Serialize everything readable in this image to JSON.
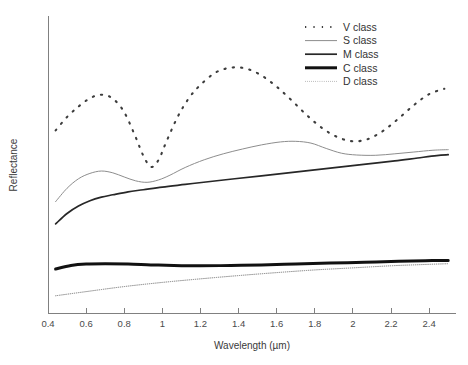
{
  "chart_data": {
    "type": "line",
    "title": "",
    "xlabel": "Wavelength (µm)",
    "ylabel": "Reflectance",
    "xlim": [
      0.4,
      2.52
    ],
    "ylim": [
      0,
      1
    ],
    "grid": false,
    "legend_position": "top-right",
    "xticks": [
      0.4,
      0.6,
      0.8,
      1.0,
      1.2,
      1.4,
      1.6,
      1.8,
      2.0,
      2.2,
      2.4
    ],
    "xticklabels": [
      "0.4",
      "0.6",
      "0.8",
      "1",
      "1.2",
      "1.4",
      "1.6",
      "1.8",
      "2",
      "2.2",
      "2.4"
    ],
    "yticks": [],
    "yticklabels": [],
    "series": [
      {
        "name": "V class",
        "style": "dotted-thick",
        "color": "#3d3d3d",
        "width": 2.1,
        "dash": "0.6 3.4",
        "x": [
          0.44,
          0.5,
          0.56,
          0.62,
          0.68,
          0.74,
          0.8,
          0.86,
          0.9,
          0.94,
          0.98,
          1.02,
          1.08,
          1.14,
          1.2,
          1.28,
          1.36,
          1.44,
          1.52,
          1.6,
          1.68,
          1.76,
          1.84,
          1.92,
          2.0,
          2.08,
          2.16,
          2.24,
          2.32,
          2.4,
          2.48
        ],
        "y": [
          0.615,
          0.66,
          0.695,
          0.723,
          0.735,
          0.722,
          0.676,
          0.592,
          0.53,
          0.492,
          0.515,
          0.575,
          0.66,
          0.724,
          0.768,
          0.81,
          0.826,
          0.823,
          0.8,
          0.762,
          0.715,
          0.665,
          0.622,
          0.592,
          0.578,
          0.586,
          0.614,
          0.655,
          0.7,
          0.737,
          0.755
        ]
      },
      {
        "name": "S class",
        "style": "solid-thin",
        "color": "#8d8d8d",
        "width": 1.0,
        "dash": "",
        "x": [
          0.44,
          0.5,
          0.56,
          0.62,
          0.68,
          0.74,
          0.8,
          0.86,
          0.92,
          0.98,
          1.04,
          1.12,
          1.22,
          1.32,
          1.42,
          1.52,
          1.62,
          1.7,
          1.78,
          1.86,
          1.94,
          2.02,
          2.12,
          2.22,
          2.32,
          2.42,
          2.5
        ],
        "y": [
          0.375,
          0.42,
          0.452,
          0.47,
          0.478,
          0.472,
          0.458,
          0.445,
          0.44,
          0.448,
          0.464,
          0.49,
          0.516,
          0.536,
          0.552,
          0.566,
          0.576,
          0.578,
          0.572,
          0.554,
          0.538,
          0.532,
          0.531,
          0.536,
          0.542,
          0.548,
          0.55
        ]
      },
      {
        "name": "M class",
        "style": "solid-medium",
        "color": "#272727",
        "width": 1.7,
        "dash": "",
        "x": [
          0.44,
          0.5,
          0.56,
          0.62,
          0.68,
          0.74,
          0.82,
          0.9,
          1.0,
          1.12,
          1.24,
          1.38,
          1.52,
          1.66,
          1.8,
          1.94,
          2.08,
          2.22,
          2.34,
          2.44,
          2.5
        ],
        "y": [
          0.3,
          0.335,
          0.36,
          0.378,
          0.39,
          0.398,
          0.408,
          0.415,
          0.424,
          0.433,
          0.442,
          0.452,
          0.462,
          0.472,
          0.482,
          0.492,
          0.502,
          0.512,
          0.522,
          0.53,
          0.533
        ]
      },
      {
        "name": "C class",
        "style": "solid-thick",
        "color": "#111111",
        "width": 3.0,
        "dash": "",
        "x": [
          0.44,
          0.52,
          0.6,
          0.7,
          0.82,
          0.94,
          1.06,
          1.2,
          1.36,
          1.52,
          1.7,
          1.88,
          2.06,
          2.24,
          2.38,
          2.5
        ],
        "y": [
          0.148,
          0.16,
          0.165,
          0.166,
          0.165,
          0.162,
          0.16,
          0.159,
          0.16,
          0.162,
          0.165,
          0.168,
          0.171,
          0.174,
          0.176,
          0.177
        ]
      },
      {
        "name": "D class",
        "style": "dotted-thin",
        "color": "#7a7a7a",
        "width": 1.0,
        "dash": "0.5 1.6",
        "x": [
          0.44,
          0.6,
          0.8,
          1.0,
          1.2,
          1.4,
          1.6,
          1.8,
          2.0,
          2.2,
          2.36,
          2.5
        ],
        "y": [
          0.058,
          0.072,
          0.089,
          0.103,
          0.115,
          0.126,
          0.136,
          0.145,
          0.152,
          0.159,
          0.163,
          0.166
        ]
      }
    ]
  },
  "legend": {
    "items": [
      {
        "label": "V class",
        "series": 0
      },
      {
        "label": "S class",
        "series": 1
      },
      {
        "label": "M class",
        "series": 2
      },
      {
        "label": "C class",
        "series": 3
      },
      {
        "label": "D class",
        "series": 4
      }
    ]
  },
  "axes": {
    "x_axis_color": "#808080",
    "y_axis_color": "#808080"
  }
}
